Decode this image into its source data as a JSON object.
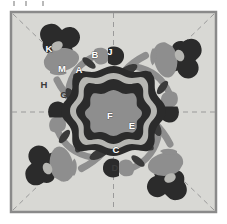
{
  "figure": {
    "name": "appliqué-block-pattern",
    "border_color": "#8a8a8a",
    "background_color": "#d8d8d4",
    "page_color": "#ffffff"
  },
  "palette": {
    "background": "#d8d8d4",
    "border": "#8a8a8a",
    "fold_line": "#9a9a9a",
    "dark": "#2b2b2b",
    "mid_gray": "#8e8e8e",
    "light_gray": "#b6b6b2",
    "stem": "#8e8e8e",
    "leaf": "#3a3a3a",
    "label_text": "#ffffff",
    "label_outline": "#2b2b2b"
  },
  "fold_lines": {
    "style": "dashed",
    "vertical": true,
    "horizontal": true,
    "diagonals": 4
  },
  "labels": [
    {
      "id": "A",
      "text": "A",
      "part": "main-stem",
      "x": 70,
      "y": 63,
      "style": "light"
    },
    {
      "id": "B",
      "text": "B",
      "part": "upper-stem",
      "x": 86,
      "y": 48,
      "style": "light"
    },
    {
      "id": "C",
      "text": "C",
      "part": "center-inner-ring",
      "x": 107,
      "y": 143,
      "style": "light"
    },
    {
      "id": "D",
      "text": "D",
      "part": "center-stem",
      "x": 106,
      "y": 161,
      "style": "dark"
    },
    {
      "id": "E",
      "text": "E",
      "part": "center-mid-ring",
      "x": 123,
      "y": 119,
      "style": "light"
    },
    {
      "id": "F",
      "text": "F",
      "part": "center-core",
      "x": 101,
      "y": 109,
      "style": "light"
    },
    {
      "id": "G",
      "text": "G",
      "part": "leaf",
      "x": 55,
      "y": 88,
      "style": "dark"
    },
    {
      "id": "H",
      "text": "H",
      "part": "calyx",
      "x": 35,
      "y": 78,
      "style": "dark"
    },
    {
      "id": "J",
      "text": "J",
      "part": "bud-body",
      "x": 101,
      "y": 45,
      "style": "light"
    },
    {
      "id": "K",
      "text": "K",
      "part": "rose-outer-petal",
      "x": 40,
      "y": 42,
      "style": "light"
    },
    {
      "id": "M",
      "text": "M",
      "part": "rose-inner-petal",
      "x": 53,
      "y": 62,
      "style": "light"
    }
  ],
  "legend_note": "Pattern pieces labeled A, B, C, D, E, F, G, H, J, K, M"
}
